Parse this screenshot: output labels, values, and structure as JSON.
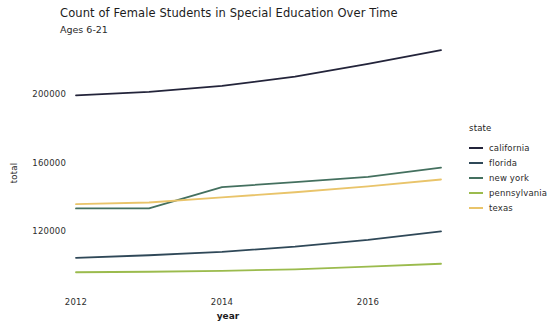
{
  "chart_data": {
    "type": "line",
    "title": "Count of Female Students in Special Education Over Time",
    "subtitle": "Ages 6-21",
    "xlabel": "year",
    "ylabel": "total",
    "grid": false,
    "legend_position": "right",
    "legend_title": "state",
    "x": [
      2012,
      2013,
      2014,
      2015,
      2016,
      2017
    ],
    "xticks": [
      "2012",
      "2014",
      "2016"
    ],
    "xtick_values": [
      2012,
      2014,
      2016
    ],
    "xlim": [
      2012,
      2017
    ],
    "yticks": [
      "200000",
      "160000",
      "120000"
    ],
    "ytick_values": [
      200000,
      160000,
      120000
    ],
    "ylim": [
      88000,
      232000
    ],
    "series": [
      {
        "name": "california",
        "color": "#23243a",
        "values": [
          199500,
          201500,
          205000,
          210500,
          218000,
          226000
        ]
      },
      {
        "name": "florida",
        "color": "#2f4858",
        "values": [
          104000,
          105500,
          107500,
          110500,
          114500,
          119500
        ]
      },
      {
        "name": "new york",
        "color": "#44705f",
        "values": [
          133000,
          133000,
          145500,
          148500,
          151500,
          157000
        ]
      },
      {
        "name": "pennsylvania",
        "color": "#9bbb4d",
        "values": [
          95500,
          95800,
          96300,
          97200,
          98800,
          100500
        ]
      },
      {
        "name": "texas",
        "color": "#e9c46a",
        "values": [
          135500,
          136500,
          139500,
          142500,
          146000,
          150000
        ]
      }
    ]
  },
  "legend": {
    "title": "state",
    "items": [
      {
        "label": "california",
        "color": "#23243a"
      },
      {
        "label": "florida",
        "color": "#2f4858"
      },
      {
        "label": "new york",
        "color": "#44705f"
      },
      {
        "label": "pennsylvania",
        "color": "#9bbb4d"
      },
      {
        "label": "texas",
        "color": "#e9c46a"
      }
    ]
  }
}
